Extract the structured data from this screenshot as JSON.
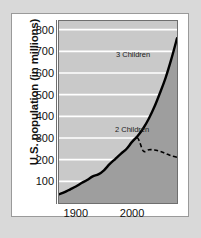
{
  "chart_data": {
    "type": "area",
    "title": "",
    "xlabel": "",
    "ylabel": "U.S. population (in millions)",
    "xlim": [
      1870,
      2080
    ],
    "ylim": [
      0,
      840
    ],
    "grid": true,
    "legend_position": "inline-annotations",
    "x_ticks": [
      {
        "value": 1900,
        "label": "1900"
      },
      {
        "value": 2000,
        "label": "2000"
      }
    ],
    "y_ticks": [
      {
        "value": 100,
        "label": "100"
      },
      {
        "value": 200,
        "label": "200"
      },
      {
        "value": 300,
        "label": "300"
      },
      {
        "value": 400,
        "label": "400"
      },
      {
        "value": 500,
        "label": "500"
      },
      {
        "value": 600,
        "label": "600"
      },
      {
        "value": 700,
        "label": "700"
      },
      {
        "value": 800,
        "label": "800"
      }
    ],
    "series": [
      {
        "name": "3 Children",
        "style": "solid",
        "color": "#000000",
        "filled": true,
        "fill_color": "#9e9e9e",
        "annotation": "3 Children",
        "x": [
          1870,
          1880,
          1890,
          1900,
          1910,
          1920,
          1930,
          1940,
          1950,
          1960,
          1970,
          1980,
          1990,
          2000,
          2010,
          2020,
          2030,
          2040,
          2050,
          2060,
          2070,
          2080
        ],
        "values": [
          40,
          50,
          63,
          76,
          92,
          106,
          123,
          132,
          151,
          179,
          203,
          227,
          249,
          282,
          309,
          345,
          390,
          445,
          510,
          580,
          665,
          760
        ]
      },
      {
        "name": "2 Children",
        "style": "dashed",
        "color": "#000000",
        "filled": false,
        "annotation": "2 Children",
        "x": [
          2000,
          2010,
          2020,
          2030,
          2040,
          2050,
          2060,
          2070,
          2080
        ],
        "values": [
          282,
          300,
          240,
          246,
          245,
          238,
          228,
          218,
          211
        ]
      }
    ],
    "annotations": [
      {
        "text": "3 Children",
        "x": 2020,
        "y": 430
      },
      {
        "text": "2 Children",
        "x": 2025,
        "y": 185
      }
    ]
  },
  "colors": {
    "page_background": "#d9d9d9",
    "figure_background": "#ffffff",
    "plot_background": "#c9c9c9",
    "area_fill": "#9e9e9e",
    "gridline": "#ffffff",
    "line": "#000000",
    "axis": "#6f6f6f",
    "text": "#111111"
  }
}
